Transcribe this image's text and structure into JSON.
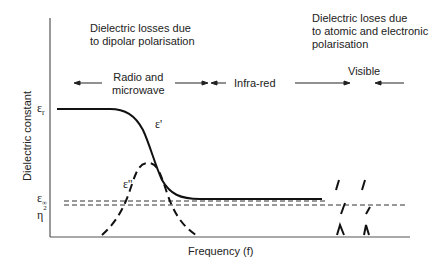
{
  "diagram": {
    "title_left": [
      "Dielectric losses due",
      "to dipolar polarisation"
    ],
    "title_right": [
      "Dielectric loses due",
      "to atomic and electronic",
      "polarisation"
    ],
    "regions": {
      "radio_microwave": [
        "Radio and",
        "microwave"
      ],
      "infrared": "Infra-red",
      "visible": "Visible"
    },
    "axes": {
      "y_label": "Dielectric constant",
      "x_label": "Frequency (f)"
    },
    "symbols": {
      "eps_r": "ε",
      "eps_r_sub": "r",
      "eps_prime": "ε'",
      "eps_double_prime": "ε''",
      "eps_inf": "ε",
      "eps_inf_sub": "∞",
      "eta": "η",
      "eta_sup": "2"
    },
    "curves": [
      {
        "name": "real permittivity ε'",
        "style": "solid",
        "description": "plateau at ε_r, sigmoid drop to ε_∞ in radio/microwave region, flat through infra-red"
      },
      {
        "name": "loss factor ε''",
        "style": "dashed",
        "description": "bell-shaped peak centred on the drop of ε'"
      },
      {
        "name": "ε_∞ level",
        "style": "dashed",
        "description": "horizontal reference line"
      },
      {
        "name": "η² level",
        "style": "dashed",
        "description": "horizontal reference line just below ε_∞"
      }
    ],
    "colors": {
      "ink": "#1a1a1a",
      "background": "#ffffff"
    }
  }
}
